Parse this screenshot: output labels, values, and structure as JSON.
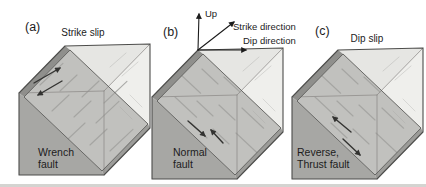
{
  "panels": [
    {
      "letter": "(a)",
      "caption": "Strike slip",
      "fault_name": [
        "Wrench",
        "fault"
      ],
      "slip_type": "strike"
    },
    {
      "letter": "(b)",
      "caption": "",
      "fault_name": [
        "Normal",
        "fault"
      ],
      "slip_type": "normal",
      "axes": {
        "up": "Up",
        "strike": "Strike direction",
        "dip": "Dip direction"
      }
    },
    {
      "letter": "(c)",
      "caption": "Dip slip",
      "fault_name": [
        "Reverse,",
        "Thrust fault"
      ],
      "slip_type": "reverse"
    }
  ],
  "colors": {
    "background": "#ffffff",
    "top_face": "#e6e6e3",
    "right_face": "#efefec",
    "fault_plane": "#c1c1be",
    "strip": "#8f8f8c",
    "front_face": "#a7a7a4",
    "base_sliver": "#9c9c99",
    "outline": "#4d4d4b",
    "inner_edge": "#908e8c",
    "fault_edge": "#5c5c5a",
    "striation": "#a3a3a0",
    "slip_arrow": "#333331",
    "axis_arrow": "#1c1c1c",
    "page_edge": "#d4d4d1"
  }
}
